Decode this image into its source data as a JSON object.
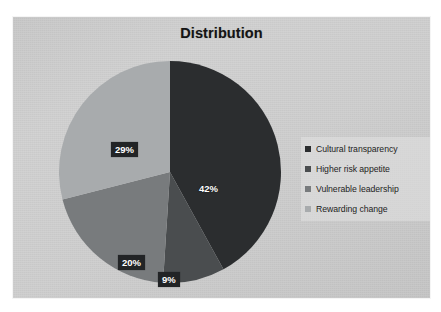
{
  "slide": {
    "title": "Distribution",
    "background_color": "#cfcfcf",
    "page_background_color": "#ffffff"
  },
  "legend": {
    "position": "right",
    "items": [
      {
        "label": "Cultural transparency",
        "color": "#2b2d2f"
      },
      {
        "label": "Higher risk appetite",
        "color": "#4a4d4f"
      },
      {
        "label": "Vulnerable leadership",
        "color": "#787b7d"
      },
      {
        "label": "Rewarding change",
        "color": "#a8abad"
      }
    ]
  },
  "chart_data": {
    "type": "pie",
    "title": "Distribution",
    "xlabel": "",
    "ylabel": "",
    "categories": [
      "Cultural transparency",
      "Higher risk appetite",
      "Vulnerable leadership",
      "Rewarding change"
    ],
    "values": [
      42,
      9,
      20,
      29
    ],
    "data_labels": [
      "42%",
      "9%",
      "20%",
      "29%"
    ],
    "colors": [
      "#2b2d2f",
      "#4a4d4f",
      "#787b7d",
      "#a8abad"
    ],
    "units": "percent",
    "start_angle_deg": 0,
    "direction": "clockwise",
    "grid": false,
    "legend_position": "right",
    "label_style": [
      "plain",
      "boxed",
      "boxed",
      "boxed"
    ]
  }
}
